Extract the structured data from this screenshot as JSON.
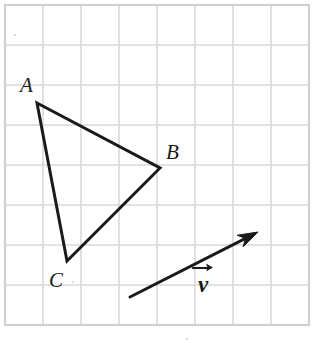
{
  "figure": {
    "background_color": "#ffffff",
    "stroke_color": "#1a1a1a",
    "grid_color": "#d9d9d9",
    "grid_border_color": "#d0d0d0",
    "width": 319,
    "height": 343
  },
  "grid": {
    "origin_x": 5,
    "origin_y": 5,
    "cell_width": 38,
    "cell_height": 40,
    "columns": 8,
    "rows": 8,
    "right_edge": 309,
    "bottom_edge": 325,
    "visible": true
  },
  "labels": {
    "vertex_a": "A",
    "vertex_b": "B",
    "vertex_c": "C",
    "vector": "v"
  },
  "chart_data": {
    "type": "diagram",
    "subtitle": "",
    "xlabel": "",
    "ylabel": "",
    "grid": true,
    "legend": "none",
    "xlim": [
      5,
      309
    ],
    "ylim": [
      5,
      325
    ],
    "shapes": [
      {
        "name": "triangle-abc",
        "type": "polygon",
        "closed": true,
        "stroke": "#1a1a1a",
        "stroke_width": 3,
        "fill": "none",
        "points": [
          {
            "label": "A",
            "x": 37,
            "y": 103
          },
          {
            "label": "B",
            "x": 160,
            "y": 168
          },
          {
            "label": "C",
            "x": 67,
            "y": 261
          }
        ]
      },
      {
        "name": "translation-vector",
        "type": "arrow",
        "stroke": "#1a1a1a",
        "stroke_width": 3,
        "label": "v",
        "tail": {
          "x": 130,
          "y": 297
        },
        "tip": {
          "x": 258,
          "y": 232
        },
        "head_length": 20,
        "head_width": 13
      }
    ],
    "annotations": [
      {
        "name": "label-A",
        "text": "A",
        "x": 28,
        "y": 90,
        "style": "italic"
      },
      {
        "name": "label-B",
        "text": "B",
        "x": 174,
        "y": 157,
        "style": "italic"
      },
      {
        "name": "label-C",
        "text": "C",
        "x": 57,
        "y": 285,
        "style": "italic"
      },
      {
        "name": "label-v",
        "text": "v",
        "x": 205,
        "y": 283,
        "style": "bold-italic-overarrow"
      }
    ]
  }
}
